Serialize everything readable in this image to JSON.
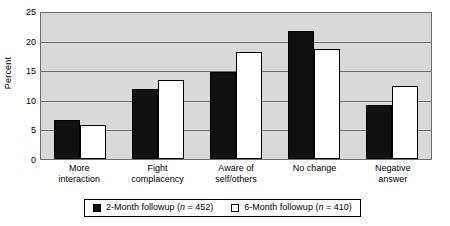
{
  "chart_data": {
    "type": "bar",
    "title": "",
    "xlabel": "",
    "ylabel": "Percent",
    "ylim": [
      0,
      25
    ],
    "yticks": [
      0,
      5,
      10,
      15,
      20,
      25
    ],
    "ytick_labels": [
      "0",
      "5",
      "10",
      "15",
      "20",
      "25"
    ],
    "grid": true,
    "legend_position": "bottom",
    "categories": [
      "More\ninteraction",
      "Fight\ncomplacency",
      "Aware of\nself/others",
      "No change",
      "Negative\nanswer"
    ],
    "series": [
      {
        "name": "2-Month followup (n = 452)",
        "legend_label_prefix": "2-Month followup (",
        "legend_n_symbol": "n",
        "legend_label_suffix": " = 452)",
        "color": "#111111",
        "values": [
          6.6,
          11.8,
          14.7,
          21.7,
          9.1
        ]
      },
      {
        "name": "6-Month followup (n = 410)",
        "legend_label_prefix": "6-Month followup (",
        "legend_n_symbol": "n",
        "legend_label_suffix": " = 410)",
        "color": "#ffffff",
        "values": [
          5.8,
          13.3,
          18.1,
          18.5,
          12.4
        ]
      }
    ]
  },
  "style": {
    "plot_background": "#d9d9d9",
    "axis_color": "#6e6e6e",
    "bar_outline": "#000000"
  }
}
